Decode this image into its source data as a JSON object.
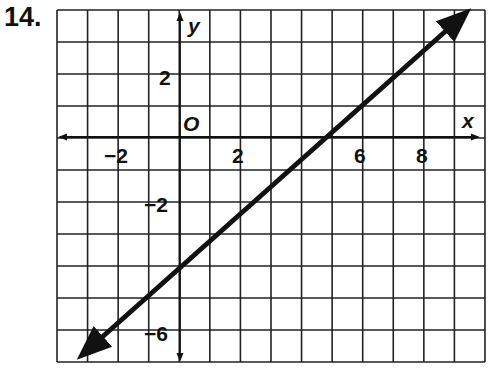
{
  "problem_number": "14.",
  "chart_data": {
    "type": "line",
    "title": "",
    "xlabel": "x",
    "ylabel": "y",
    "origin_label": "O",
    "xlim": [
      -4,
      10
    ],
    "ylim": [
      -7,
      4
    ],
    "grid": true,
    "x_tick_labels": [
      "-2",
      "2",
      "6",
      "8"
    ],
    "y_tick_labels": [
      "2",
      "-2",
      "-6"
    ],
    "series": [
      {
        "name": "line",
        "equation": "y = x - 4",
        "x": [
          -3.2,
          9.2
        ],
        "y": [
          -7.2,
          5.2
        ],
        "arrows": "both"
      }
    ],
    "points_on_line": [
      {
        "x": 0,
        "y": -4
      },
      {
        "x": 4,
        "y": 0
      }
    ]
  },
  "labels": {
    "x": "x",
    "y": "y",
    "o": "O",
    "xm2": "−2",
    "x2": "2",
    "x6": "6",
    "x8": "8",
    "y2": "2",
    "ym2": "−2",
    "ym6": "−6"
  }
}
